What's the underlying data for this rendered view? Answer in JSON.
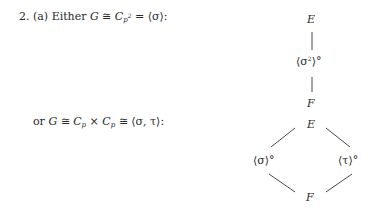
{
  "problem": {
    "number": "2.",
    "part": "(a)",
    "case1": {
      "prefix": "Either",
      "G": "G",
      "iso": "≅",
      "C": "C",
      "sub_p": "p",
      "sup_2": "2",
      "eq": "=",
      "gen": "⟨σ⟩",
      "colon": ":"
    },
    "case2": {
      "prefix": "or",
      "G": "G",
      "iso": "≅",
      "C1": "C",
      "sub1": "p",
      "times": "×",
      "C2": "C",
      "sub2": "p",
      "iso2": "≅",
      "gen": "⟨σ, τ⟩",
      "colon": ":"
    }
  },
  "diagram1": {
    "top": "E",
    "middle_left": "⟨σ",
    "middle_sup": "2",
    "middle_right": "⟩°",
    "bottom": "F"
  },
  "diagram2": {
    "top": "E",
    "left": "⟨σ⟩°",
    "right": "⟨τ⟩°",
    "bottom": "F"
  }
}
